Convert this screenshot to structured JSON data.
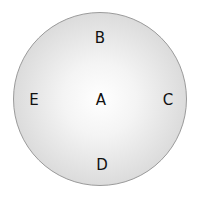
{
  "diagram": {
    "shape": "circle",
    "labels": {
      "center": "A",
      "top": "B",
      "right": "C",
      "bottom": "D",
      "left": "E"
    },
    "colors": {
      "fill_center": "#ffffff",
      "fill_edge": "#cfcfcf",
      "border": "#9a9a9a",
      "text": "#111111"
    }
  }
}
